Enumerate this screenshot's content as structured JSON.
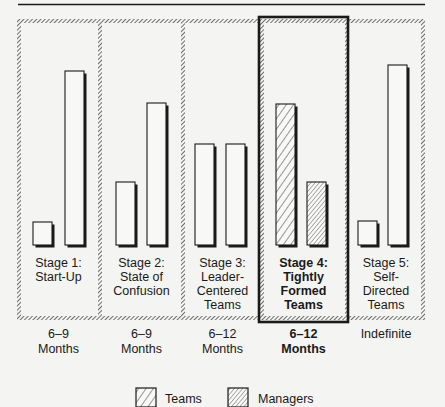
{
  "chart_data": {
    "type": "bar",
    "title": "",
    "xlabel": "",
    "ylabel": "",
    "grid": false,
    "legend_position": "bottom",
    "categories": [
      "Stage 1: Start-Up",
      "Stage 2: State of Confusion",
      "Stage 3: Leader-Centered Teams",
      "Stage 4: Tightly Formed Teams",
      "Stage 5: Self-Directed Teams"
    ],
    "series": [
      {
        "name": "Teams",
        "values": [
          23,
          63,
          101,
          141,
          180
        ]
      },
      {
        "name": "Managers",
        "values": [
          174,
          142,
          101,
          63,
          24
        ]
      }
    ],
    "ylim": [
      0,
      190
    ],
    "highlighted_category": "Stage 4: Tightly Formed Teams",
    "durations": [
      "6–9 Months",
      "6–9 Months",
      "6–12 Months",
      "6–12 Months",
      "Indefinite"
    ]
  },
  "stages": [
    {
      "lines": [
        "Stage 1:",
        "Start-Up"
      ],
      "duration": [
        "6–9",
        "Months"
      ],
      "highlight": false
    },
    {
      "lines": [
        "Stage 2:",
        "State of",
        "Confusion"
      ],
      "duration": [
        "6–9",
        "Months"
      ],
      "highlight": false
    },
    {
      "lines": [
        "Stage 3:",
        "Leader-",
        "Centered",
        "Teams"
      ],
      "duration": [
        "6–12",
        "Months"
      ],
      "highlight": false
    },
    {
      "lines": [
        "Stage 4:",
        "Tightly",
        "Formed",
        "Teams"
      ],
      "duration": [
        "6–12",
        "Months"
      ],
      "highlight": true
    },
    {
      "lines": [
        "Stage 5:",
        "Self-",
        "Directed",
        "Teams"
      ],
      "duration": [
        "Indefinite"
      ],
      "highlight": false
    }
  ],
  "legend": {
    "teams_label": "Teams",
    "managers_label": "Managers"
  },
  "colors": {
    "ink": "#1a1a1a",
    "background": "#f4f4f2",
    "bar_fill": "#f8f8f6"
  }
}
